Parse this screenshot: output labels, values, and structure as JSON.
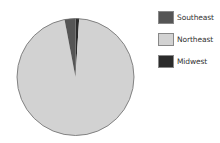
{
  "chart_data": {
    "type": "pie",
    "title": "",
    "categories": [
      "Southeast",
      "Northeast",
      "Midwest"
    ],
    "values": [
      3,
      96,
      1
    ],
    "colors": [
      "#555555",
      "#d2d2d2",
      "#2b2b2b"
    ],
    "legend_position": "right",
    "start_angle_deg": 0,
    "outline_color": "#6a6a6a"
  },
  "legend": {
    "items": [
      {
        "label": "Southeast",
        "color": "#555555"
      },
      {
        "label": "Northeast",
        "color": "#d2d2d2"
      },
      {
        "label": "Midwest",
        "color": "#2b2b2b"
      }
    ]
  }
}
